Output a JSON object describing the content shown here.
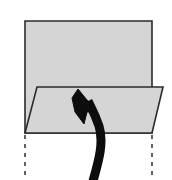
{
  "figure": {
    "title": "Folded plane diagram",
    "background_color": "#ffffff",
    "canvas": {
      "width": 172,
      "height": 180
    }
  },
  "style": {
    "shape_fill": "#d5d5d5",
    "shape_stroke": "#2b2b2b",
    "shape_stroke_width": 1.6,
    "dashed_stroke": "#3a3a3a",
    "dashed_stroke_width": 1.6,
    "dash_pattern": "4 5",
    "arrow_fill": "#0d0d0d",
    "arrow_stroke": "#0d0d0d"
  },
  "shapes": {
    "back_rectangle": {
      "label": "back-plane-rectangle",
      "points": "25,21 152,21 152,133 25,133",
      "fill": "#d5d5d5",
      "stroke": "#2b2b2b"
    },
    "front_parallelogram": {
      "label": "folded-flap-parallelogram",
      "points": "37,87 163,87 152,133 25,133",
      "fill": "#d5d5d5",
      "stroke": "#2b2b2b"
    }
  },
  "dashed_lines": [
    {
      "label": "left-construction-line",
      "x1": 25,
      "y1": 135,
      "x2": 25,
      "y2": 180
    },
    {
      "label": "right-construction-line",
      "x1": 152,
      "y1": 135,
      "x2": 152,
      "y2": 180
    }
  ],
  "arrow": {
    "label": "fold-direction-arrow",
    "direction": "up-left",
    "tip": {
      "x": 80,
      "y": 90
    },
    "tail": {
      "x": 93,
      "y": 180
    },
    "shaft_path": "M 93,181 C 99,160 104,142 99,126 C 95,114 91,107 88,101",
    "shaft_width": 9,
    "head_points": "78,89 96,111 87,112 84,124 75,112 72,98"
  }
}
